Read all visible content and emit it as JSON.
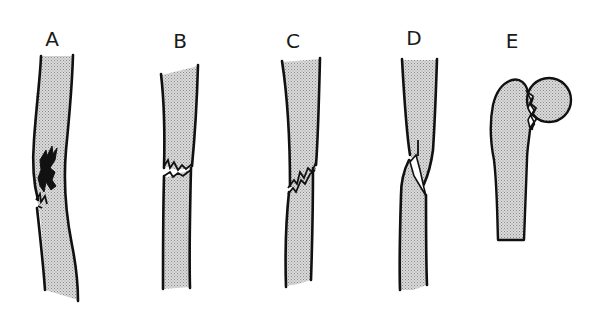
{
  "figure": {
    "background": "#ffffff",
    "fill_color": "#cfcfcf",
    "line_color": "#111111",
    "panels": [
      {
        "id": "A",
        "label": "A",
        "bone": "long-bone-shaft",
        "fracture": "greenstick / incomplete, jagged crack on left side"
      },
      {
        "id": "B",
        "label": "B",
        "bone": "long-bone-shaft",
        "fracture": "transverse, complete break across shaft"
      },
      {
        "id": "C",
        "label": "C",
        "bone": "long-bone-shaft",
        "fracture": "oblique jagged break"
      },
      {
        "id": "D",
        "label": "D",
        "bone": "long-bone-shaft",
        "fracture": "spiral, overlapping fragments"
      },
      {
        "id": "E",
        "label": "E",
        "bone": "proximal femur",
        "fracture": "femoral neck / head fracture"
      }
    ]
  }
}
